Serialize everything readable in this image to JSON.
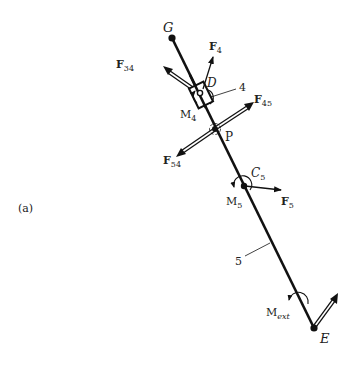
{
  "figure": {
    "panel_label": "(a)",
    "link_label": "5",
    "slider_label": "4"
  },
  "points": {
    "G": {
      "label": "G",
      "x": 172,
      "y": 38
    },
    "D": {
      "label": "D",
      "x": 201,
      "y": 95
    },
    "P": {
      "label": "P",
      "x": 215,
      "y": 129
    },
    "C5": {
      "label": "C",
      "sub": "5",
      "x": 244,
      "y": 186
    },
    "E": {
      "label": "E",
      "x": 314,
      "y": 328
    }
  },
  "forces": {
    "F4": {
      "label": "F",
      "sub": "4"
    },
    "F34": {
      "label": "F",
      "sub": "34"
    },
    "F45": {
      "label": "F",
      "sub": "45"
    },
    "F54": {
      "label": "F",
      "sub": "54"
    },
    "F5": {
      "label": "F",
      "sub": "5"
    }
  },
  "moments": {
    "M4": {
      "label": "M",
      "sub": "4"
    },
    "M5": {
      "label": "M",
      "sub": "5"
    },
    "Mext": {
      "label": "M",
      "sub": "ext"
    }
  },
  "colors": {
    "ink": "#111111",
    "text": "#222222",
    "background": "#ffffff"
  }
}
